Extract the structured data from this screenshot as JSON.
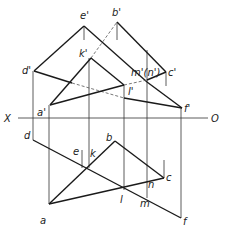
{
  "figure": {
    "axis": {
      "left_label": "X",
      "right_label": "O"
    },
    "front_view_labels": {
      "e": "e'",
      "b": "b'",
      "k": "k'",
      "d": "d'",
      "m_n": "m'(n')",
      "c": "c'",
      "l": "l'",
      "a": "a'",
      "f": "f'"
    },
    "top_view_labels": {
      "d": "d",
      "e": "e",
      "k": "k",
      "b": "b",
      "c": "c",
      "n": "n",
      "l": "l",
      "m": "m",
      "a": "a",
      "f": "f"
    }
  }
}
